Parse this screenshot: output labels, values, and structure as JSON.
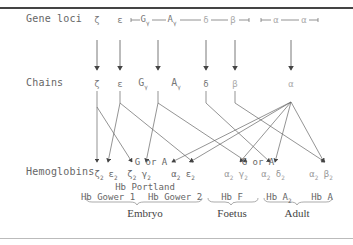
{
  "rows": {
    "gene_loci": "Gene loci",
    "chains": "Chains",
    "hemoglobins": "Hemoglobins"
  },
  "gene_loci": [
    {
      "symbol": "ζ",
      "sub": ""
    },
    {
      "symbol": "ε",
      "sub": ""
    },
    {
      "symbol": "G",
      "sub": "γ"
    },
    {
      "symbol": "A",
      "sub": "γ"
    },
    {
      "symbol": "δ",
      "sub": ""
    },
    {
      "symbol": "β",
      "sub": ""
    },
    {
      "symbol": "α",
      "sub": "2"
    },
    {
      "symbol": "α",
      "sub": "1"
    }
  ],
  "chains": [
    {
      "symbol": "ζ",
      "sub": ""
    },
    {
      "symbol": "ε",
      "sub": ""
    },
    {
      "symbol": "G",
      "sub": "γ"
    },
    {
      "symbol": "A",
      "sub": "γ"
    },
    {
      "symbol": "δ",
      "sub": ""
    },
    {
      "symbol": "β",
      "sub": ""
    },
    {
      "symbol": "α",
      "sub": ""
    }
  ],
  "hemoglobins": [
    {
      "a": "ζ",
      "b": "ε"
    },
    {
      "a": "ζ",
      "b": "γ"
    },
    {
      "a": "α",
      "b": "ε"
    },
    {
      "a": "α",
      "b": "γ"
    },
    {
      "a": "α",
      "b": "δ"
    },
    {
      "a": "α",
      "b": "β"
    }
  ],
  "gamma_note": "G or A",
  "names": {
    "portland": "Hb Portland",
    "gower1": "Hb Gower 1",
    "gower2": "Hb Gower 2",
    "hbf": "Hb F",
    "hba2": "Hb A",
    "hba2_sub": "2",
    "hba": "Hb A"
  },
  "stages": {
    "embryo": "Embryo",
    "foetus": "Foetus",
    "adult": "Adult"
  }
}
